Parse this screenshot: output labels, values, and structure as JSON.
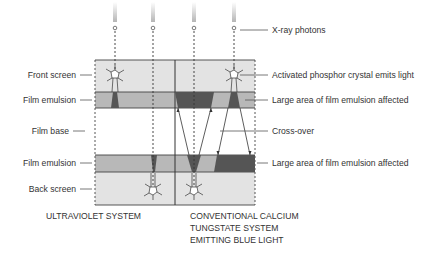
{
  "diagram": {
    "left_labels": {
      "front_screen": "Front screen",
      "film_emulsion_top": "Film emulsion",
      "film_base": "Film base",
      "film_emulsion_bottom": "Film emulsion",
      "back_screen": "Back screen"
    },
    "right_labels": {
      "xray_photons": "X-ray photons",
      "activated_crystal": "Activated phosphor crystal emits light",
      "large_area_top": "Large area of film emulsion affected",
      "cross_over": "Cross-over",
      "large_area_bottom": "Large area of film emulsion affected"
    },
    "captions": {
      "left_system": "ULTRAVIOLET SYSTEM",
      "right_system_line1": "CONVENTIONAL CALCIUM",
      "right_system_line2": "TUNGSTATE SYSTEM",
      "right_system_line3": "EMITTING BLUE LIGHT"
    },
    "colors": {
      "screen": "#e3e3e3",
      "emulsion": "#b8b8b8",
      "exposed": "#555555",
      "outline": "#444444",
      "text": "#333333"
    }
  }
}
